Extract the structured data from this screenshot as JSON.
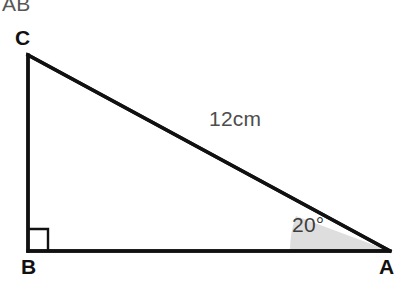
{
  "figure": {
    "title_fragment": "AB",
    "background_color": "#ffffff",
    "stroke_color": "#111111",
    "shade_color": "#dedede",
    "text_color": "#4a4a4a",
    "label_color": "#111111",
    "vertices": {
      "c": {
        "label": "C",
        "x": 28,
        "y": 55
      },
      "b": {
        "label": "B",
        "x": 28,
        "y": 251
      },
      "a": {
        "label": "A",
        "x": 390,
        "y": 251
      }
    },
    "edges": {
      "hypotenuse_label": "12cm",
      "hypotenuse_from": "C",
      "hypotenuse_to": "A",
      "vertical_from": "C",
      "vertical_to": "B",
      "base_from": "B",
      "base_to": "A"
    },
    "angle_marks": {
      "right_angle": {
        "at": "B",
        "type": "right-angle-square",
        "size": 20
      },
      "marked_angle": {
        "at": "A",
        "value": "20°",
        "degrees": 20,
        "radius": 100,
        "shaded": true
      }
    }
  }
}
